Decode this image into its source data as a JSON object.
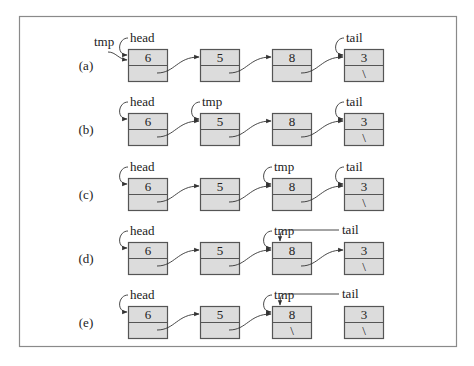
{
  "diagram": {
    "title": "",
    "colors": {
      "node_fill": "#dcdcdc",
      "node_border": "#555555",
      "frame": "#8a8a8a",
      "text": "#222222"
    },
    "rows": [
      {
        "label": "(a)",
        "nodes": [
          {
            "value": "6",
            "next": ""
          },
          {
            "value": "5",
            "next": ""
          },
          {
            "value": "8",
            "next": ""
          },
          {
            "value": "3",
            "next": "\\"
          }
        ],
        "links": [
          [
            0,
            1
          ],
          [
            1,
            2
          ],
          [
            2,
            3
          ]
        ],
        "pointers": [
          {
            "name": "head",
            "target": 0
          },
          {
            "name": "tmp",
            "target": 0
          },
          {
            "name": "tail",
            "target": 3
          }
        ]
      },
      {
        "label": "(b)",
        "nodes": [
          {
            "value": "6",
            "next": ""
          },
          {
            "value": "5",
            "next": ""
          },
          {
            "value": "8",
            "next": ""
          },
          {
            "value": "3",
            "next": "\\"
          }
        ],
        "links": [
          [
            0,
            1
          ],
          [
            1,
            2
          ],
          [
            2,
            3
          ]
        ],
        "pointers": [
          {
            "name": "head",
            "target": 0
          },
          {
            "name": "tmp",
            "target": 1
          },
          {
            "name": "tail",
            "target": 3
          }
        ]
      },
      {
        "label": "(c)",
        "nodes": [
          {
            "value": "6",
            "next": ""
          },
          {
            "value": "5",
            "next": ""
          },
          {
            "value": "8",
            "next": ""
          },
          {
            "value": "3",
            "next": "\\"
          }
        ],
        "links": [
          [
            0,
            1
          ],
          [
            1,
            2
          ],
          [
            2,
            3
          ]
        ],
        "pointers": [
          {
            "name": "head",
            "target": 0
          },
          {
            "name": "tmp",
            "target": 2
          },
          {
            "name": "tail",
            "target": 3
          }
        ]
      },
      {
        "label": "(d)",
        "nodes": [
          {
            "value": "6",
            "next": ""
          },
          {
            "value": "5",
            "next": ""
          },
          {
            "value": "8",
            "next": ""
          },
          {
            "value": "3",
            "next": "\\"
          }
        ],
        "links": [
          [
            0,
            1
          ],
          [
            1,
            2
          ],
          [
            2,
            3
          ]
        ],
        "pointers": [
          {
            "name": "head",
            "target": 0
          },
          {
            "name": "tmp",
            "target": 2
          },
          {
            "name": "tail",
            "target": 2
          }
        ]
      },
      {
        "label": "(e)",
        "nodes": [
          {
            "value": "6",
            "next": ""
          },
          {
            "value": "5",
            "next": ""
          },
          {
            "value": "8",
            "next": "\\"
          },
          {
            "value": "3",
            "next": "\\"
          }
        ],
        "links": [
          [
            0,
            1
          ],
          [
            1,
            2
          ]
        ],
        "pointers": [
          {
            "name": "head",
            "target": 0
          },
          {
            "name": "tmp",
            "target": 2
          },
          {
            "name": "tail",
            "target": 2
          }
        ]
      }
    ]
  }
}
